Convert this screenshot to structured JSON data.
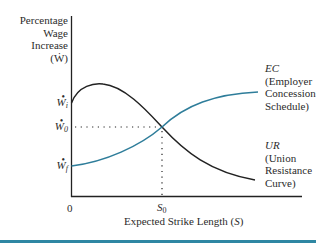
{
  "diagram": {
    "y_axis": {
      "label_lines": [
        "Percentage",
        "Wage",
        "Increase",
        "(Ẇ)"
      ],
      "ticks": [
        {
          "symbol": "W",
          "subscript": "i",
          "y": 103
        },
        {
          "symbol": "W",
          "subscript": "0",
          "y": 127
        },
        {
          "symbol": "W",
          "subscript": "f",
          "y": 166
        }
      ]
    },
    "x_axis": {
      "origin_label": "0",
      "tick": {
        "symbol": "S",
        "subscript": "0"
      },
      "label": "Expected Strike Length (S)",
      "label_prefix": "Expected Strike Length (",
      "label_var": "S",
      "label_suffix": ")"
    },
    "curves": [
      {
        "id": "EC",
        "abbr": "EC",
        "name_lines": [
          "(Employer",
          "Concession",
          "Schedule)"
        ],
        "color": "#2e7d9a",
        "shape": "rising concave from W_f to plateau"
      },
      {
        "id": "UR",
        "abbr": "UR",
        "name_lines": [
          "(Union",
          "Resistance",
          "Curve)"
        ],
        "color": "#222222",
        "shape": "rising from W_i to peak then falling"
      }
    ],
    "equilibrium": {
      "label": "intersection at (S0, W0)"
    },
    "colors": {
      "accent": "#2e7d9a",
      "axis": "#222222",
      "footer_bar": "#2f87a3"
    }
  }
}
